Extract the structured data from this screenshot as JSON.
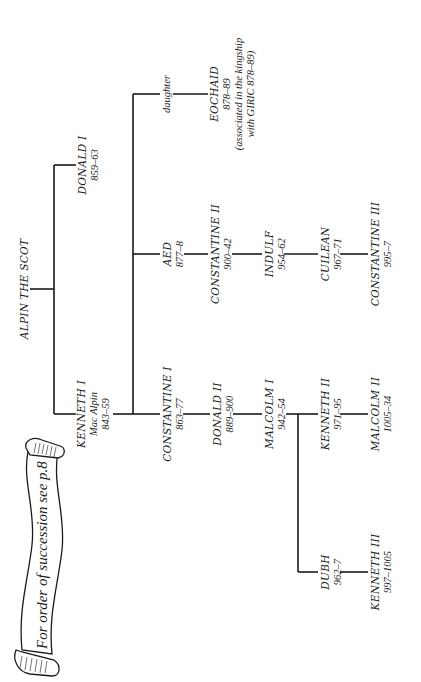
{
  "scroll": {
    "text": "For order of succession see p.8"
  },
  "people": {
    "alpin": {
      "name": "ALPIN THE SCOT"
    },
    "donald1": {
      "name": "DONALD I",
      "reign": "859–63"
    },
    "kenneth1": {
      "name": "KENNETH I",
      "epithet": "Mac Alpin",
      "reign": "843–59"
    },
    "daughter": {
      "name": "daughter"
    },
    "eochaid": {
      "name": "EOCHAID",
      "reign": "878–89",
      "note_line1": "(associated in the kingship",
      "note_line2": "with GIRIC 878–89)"
    },
    "aed": {
      "name": "AED",
      "reign": "877–8"
    },
    "constantine2": {
      "name": "CONSTANTINE II",
      "reign": "900–42"
    },
    "indulf": {
      "name": "INDULF",
      "reign": "954–62"
    },
    "cuilean": {
      "name": "CUILEAN",
      "reign": "967–71"
    },
    "constantine3": {
      "name": "CONSTANTINE III",
      "reign": "995–7"
    },
    "constantine1": {
      "name": "CONSTANTINE I",
      "reign": "863–77"
    },
    "donald2": {
      "name": "DONALD II",
      "reign": "889–900"
    },
    "malcolm1": {
      "name": "MALCOLM I",
      "reign": "942–54"
    },
    "kenneth2": {
      "name": "KENNETH II",
      "reign": "971–95"
    },
    "malcolm2": {
      "name": "MALCOLM II",
      "reign": "1005–34"
    },
    "dubh": {
      "name": "DUBH",
      "reign": "962–7"
    },
    "kenneth3": {
      "name": "KENNETH III",
      "reign": "997–1005"
    }
  }
}
